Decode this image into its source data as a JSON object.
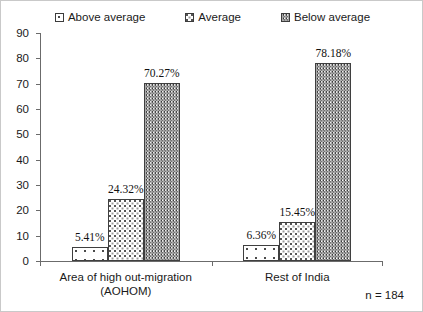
{
  "chart_data": {
    "type": "bar",
    "title": "",
    "xlabel": "",
    "ylabel": "",
    "ylim": [
      0,
      90
    ],
    "ytick_step": 10,
    "yticks": [
      90,
      80,
      70,
      60,
      50,
      40,
      30,
      20,
      10,
      0
    ],
    "grid": false,
    "legend_position": "top",
    "categories": [
      "Area of high out-migration\n(AOHOM)",
      "Rest of India"
    ],
    "category_lines": [
      [
        "Area of high out-migration",
        "(AOHOM)"
      ],
      [
        "Rest of India"
      ]
    ],
    "series": [
      {
        "name": "Above average",
        "pattern": "sparse-dots",
        "values": [
          5.41,
          6.36
        ],
        "labels": [
          "5.41%",
          "6.36%"
        ]
      },
      {
        "name": "Average",
        "pattern": "dense-checker-dots",
        "values": [
          24.32,
          15.45
        ],
        "labels": [
          "24.32%",
          "15.45%"
        ]
      },
      {
        "name": "Below average",
        "pattern": "vertical-striped-dots",
        "values": [
          70.27,
          78.18
        ],
        "labels": [
          "70.27%",
          "78.18%"
        ]
      }
    ],
    "annotations": [
      {
        "name": "sample-size",
        "text": "n = 184"
      }
    ],
    "colors": {
      "axis": "#6b6b6b",
      "bar_outline": "#3f3f3f",
      "text": "#1a1a1a",
      "background": "#ffffff",
      "border": "#c9c9c9"
    }
  },
  "legend": {
    "items": [
      {
        "label": "Above average",
        "swatch": "pat-above"
      },
      {
        "label": "Average",
        "swatch": "pat-avg"
      },
      {
        "label": "Below average",
        "swatch": "pat-below"
      }
    ]
  },
  "footnote": "n = 184"
}
